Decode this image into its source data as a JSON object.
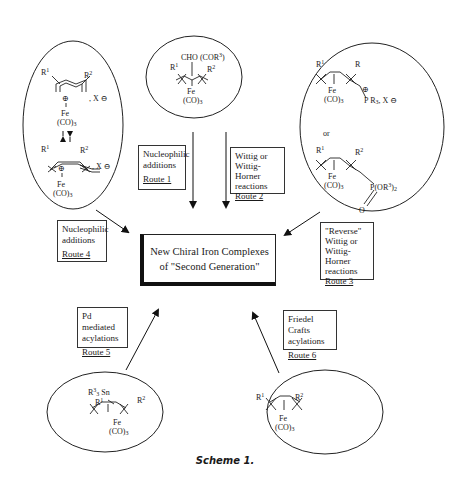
{
  "center": {
    "line1": "New Chiral Iron Complexes",
    "line2": "of  \"Second Generation\""
  },
  "routes": [
    {
      "id": 1,
      "lines": [
        "Nucleophilic",
        "additions"
      ],
      "route": "Route 1"
    },
    {
      "id": 2,
      "lines": [
        "Wittig or",
        "Wittig-Horner",
        "reactions"
      ],
      "route": "Route 2"
    },
    {
      "id": 3,
      "lines": [
        "\"Reverse\"",
        "Wittig or",
        "Wittig-Horner",
        "reactions"
      ],
      "route": "Route 3"
    },
    {
      "id": 4,
      "lines": [
        "Nucleophilic",
        "additions"
      ],
      "route": "Route 4"
    },
    {
      "id": 5,
      "lines": [
        "Pd mediated",
        "acylations"
      ],
      "route": "Route 5"
    },
    {
      "id": 6,
      "lines": [
        "Friedel Crafts",
        "acylations"
      ],
      "route": "Route 6"
    }
  ],
  "structures": {
    "top": {
      "substituent": "CHO (COR",
      "sub_sup": "3",
      "sub_close": ")",
      "r1": "R",
      "r1_sup": "1",
      "r2": "R",
      "r2_sup": "2",
      "fe": "Fe",
      "co": "(CO)",
      "co_sub": "3"
    },
    "left": {
      "r1": "R",
      "r1_sup": "1",
      "r2": "R",
      "r2_sup": "2",
      "counterion": ", X",
      "fe": "Fe",
      "co": "(CO)",
      "co_sub": "3",
      "charge": "+",
      "anion_charge": "−"
    },
    "right": {
      "r1": "R",
      "r1_sup": "1",
      "r_top": "R",
      "r2": "R",
      "r2_sup": "2",
      "phosphonium": "P R",
      "phosphonium_sub": "3",
      "phosphonium_tail": ", X",
      "or": "or",
      "phosphonate": "P(OR",
      "phosphonate_sup": "3",
      "phosphonate_tail": ")",
      "phosphonate_sub": "2",
      "oxygen": "O",
      "fe": "Fe",
      "co": "(CO)",
      "co_sub": "3"
    },
    "bottom_left": {
      "tin": "R",
      "tin_sup": "3",
      "tin_sub": "3",
      "tin_tail": " Sn",
      "r1": "R",
      "r1_sup": "1",
      "r2": "R",
      "r2_sup": "2",
      "fe": "Fe",
      "co": "(CO)",
      "co_sub": "3"
    },
    "bottom_right": {
      "r1": "R",
      "r1_sup": "1",
      "r2": "R",
      "r2_sup": "2",
      "fe": "Fe",
      "co": "(CO)",
      "co_sub": "3"
    }
  },
  "caption": "Scheme 1."
}
